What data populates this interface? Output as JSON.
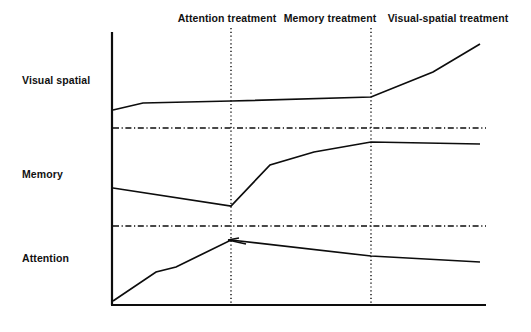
{
  "figure": {
    "background_color": "#ffffff",
    "ink_color": "#0d0d0d"
  },
  "phases": [
    {
      "id": "attention",
      "label": "Attention treatment",
      "label_x": 227,
      "label_y": 18
    },
    {
      "id": "memory",
      "label": "Memory treatment",
      "label_x": 330,
      "label_y": 18
    },
    {
      "id": "visual-spatial",
      "label": "Visual-spatial treatment",
      "label_x": 448,
      "label_y": 18
    }
  ],
  "tiers": [
    {
      "id": "visual-spatial",
      "label": "Visual spatial",
      "label_x": 22,
      "label_y": 80
    },
    {
      "id": "memory",
      "label": "Memory",
      "label_x": 22,
      "label_y": 174
    },
    {
      "id": "attention",
      "label": "Attention",
      "label_x": 22,
      "label_y": 258
    }
  ],
  "axes": {
    "x_axis": {
      "x1": 112,
      "y1": 305,
      "x2": 486,
      "y2": 305,
      "width": 2.2
    },
    "y_axis": {
      "x1": 112,
      "y1": 32,
      "x2": 112,
      "y2": 305,
      "width": 2.2
    }
  },
  "phase_dividers": [
    {
      "id": "divider-1",
      "x": 231,
      "y_top": 28,
      "y_bottom": 305
    },
    {
      "id": "divider-2",
      "x": 371,
      "y_top": 28,
      "y_bottom": 305
    }
  ],
  "tier_separators": [
    {
      "id": "separator-upper",
      "x1": 112,
      "y": 128,
      "x2": 486
    },
    {
      "id": "separator-lower",
      "x1": 112,
      "y": 226,
      "x2": 486
    }
  ],
  "chart_data": {
    "type": "line",
    "title": "",
    "subtitle": "",
    "xlabel": "",
    "ylabel": "",
    "grid": false,
    "legend_position": "none",
    "axis_ranges": {
      "x_pixels": [
        112,
        486
      ],
      "y_pixels": [
        32,
        305
      ]
    },
    "phase_boundaries_x": [
      231,
      371
    ],
    "series": [
      {
        "name": "Visual spatial",
        "tier": "visual-spatial",
        "points": [
          {
            "x": 113,
            "y": 110
          },
          {
            "x": 143,
            "y": 103
          },
          {
            "x": 231,
            "y": 101
          },
          {
            "x": 371,
            "y": 97
          },
          {
            "x": 433,
            "y": 72
          },
          {
            "x": 480,
            "y": 44
          }
        ]
      },
      {
        "name": "Memory",
        "tier": "memory",
        "points": [
          {
            "x": 113,
            "y": 188
          },
          {
            "x": 231,
            "y": 206
          },
          {
            "x": 270,
            "y": 165
          },
          {
            "x": 314,
            "y": 152
          },
          {
            "x": 371,
            "y": 142
          },
          {
            "x": 480,
            "y": 144
          }
        ]
      },
      {
        "name": "Attention",
        "tier": "attention",
        "points": [
          {
            "x": 113,
            "y": 301
          },
          {
            "x": 156,
            "y": 272
          },
          {
            "x": 176,
            "y": 267
          },
          {
            "x": 231,
            "y": 240
          },
          {
            "x": 371,
            "y": 256
          },
          {
            "x": 480,
            "y": 262
          }
        ]
      }
    ],
    "annotations": [
      {
        "id": "attention-peak-arrow",
        "type": "arrowhead",
        "x": 231,
        "y": 241,
        "note": "small arrowhead at the Attention tier peak where the rising trend meets the first phase divider"
      }
    ]
  }
}
